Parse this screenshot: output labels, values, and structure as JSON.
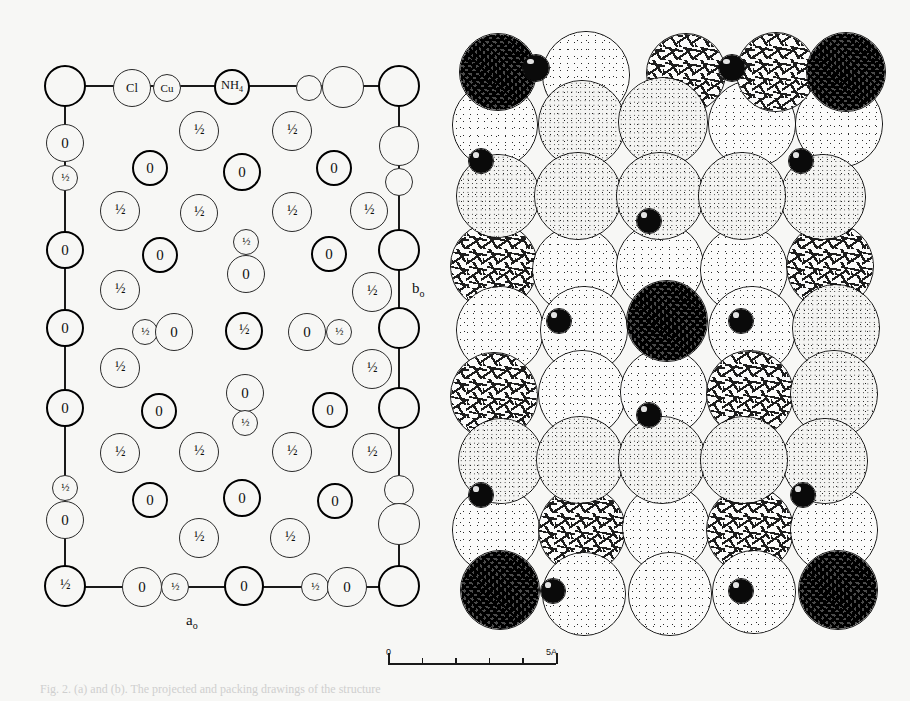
{
  "figure": {
    "caption": "Fig. 2. (a) and (b). The projected and packing drawings of the structure",
    "axis_a_label": "a",
    "axis_a_sub": "o",
    "axis_b_label": "b",
    "axis_b_sub": "o"
  },
  "scalebar": {
    "start_label": "0",
    "end_label": "5A",
    "major_ticks": 5,
    "minor_ticks": 4
  },
  "legend_labels": {
    "chlorine": "Cl",
    "copper": "Cu",
    "ammonium": "NH4",
    "ammonium_display": "NH",
    "ammonium_sub": "4",
    "oxygen": "0",
    "half_height": "1/2"
  },
  "left_panel": {
    "name": "projected-unit-cell",
    "atoms": [
      {
        "id": "a1",
        "x": 18,
        "y": 18,
        "r": 21,
        "weight": "bold",
        "label": "",
        "kind": "corner"
      },
      {
        "id": "a2",
        "x": 85,
        "y": 20,
        "r": 19,
        "weight": "thin",
        "label": "Cl",
        "kind": "named"
      },
      {
        "id": "a3",
        "x": 120,
        "y": 20,
        "r": 14,
        "weight": "thin",
        "label": "Cu",
        "kind": "named"
      },
      {
        "id": "a4",
        "x": 185,
        "y": 19,
        "r": 18,
        "weight": "bold",
        "label": "NH4",
        "kind": "named"
      },
      {
        "id": "a5",
        "x": 262,
        "y": 20,
        "r": 13,
        "weight": "thin",
        "label": "",
        "kind": "plain"
      },
      {
        "id": "a6",
        "x": 296,
        "y": 19,
        "r": 21,
        "weight": "thin",
        "label": "",
        "kind": "plain"
      },
      {
        "id": "a7",
        "x": 352,
        "y": 18,
        "r": 21,
        "weight": "bold",
        "label": "",
        "kind": "corner"
      },
      {
        "id": "b1",
        "x": 18,
        "y": 75,
        "r": 19,
        "weight": "thin",
        "label": "0",
        "kind": "o"
      },
      {
        "id": "b2",
        "x": 18,
        "y": 110,
        "r": 13,
        "weight": "thin",
        "label": "1/2",
        "kind": "half-sm"
      },
      {
        "id": "b3",
        "x": 352,
        "y": 78,
        "r": 20,
        "weight": "thin",
        "label": "",
        "kind": "plain"
      },
      {
        "id": "b4",
        "x": 352,
        "y": 114,
        "r": 14,
        "weight": "thin",
        "label": "",
        "kind": "plain"
      },
      {
        "id": "c1",
        "x": 152,
        "y": 63,
        "r": 20,
        "weight": "thin",
        "label": "1/2",
        "kind": "half"
      },
      {
        "id": "c2",
        "x": 245,
        "y": 63,
        "r": 20,
        "weight": "thin",
        "label": "1/2",
        "kind": "half"
      },
      {
        "id": "c3",
        "x": 103,
        "y": 100,
        "r": 18,
        "weight": "bold",
        "label": "0",
        "kind": "o"
      },
      {
        "id": "c4",
        "x": 195,
        "y": 104,
        "r": 19,
        "weight": "bold",
        "label": "0",
        "kind": "o"
      },
      {
        "id": "c5",
        "x": 287,
        "y": 100,
        "r": 18,
        "weight": "bold",
        "label": "0",
        "kind": "o"
      },
      {
        "id": "d1",
        "x": 73,
        "y": 143,
        "r": 20,
        "weight": "thin",
        "label": "1/2",
        "kind": "half"
      },
      {
        "id": "d2",
        "x": 152,
        "y": 145,
        "r": 19,
        "weight": "thin",
        "label": "1/2",
        "kind": "half"
      },
      {
        "id": "d3",
        "x": 245,
        "y": 144,
        "r": 20,
        "weight": "thin",
        "label": "1/2",
        "kind": "half"
      },
      {
        "id": "d4",
        "x": 322,
        "y": 143,
        "r": 19,
        "weight": "thin",
        "label": "1/2",
        "kind": "half"
      },
      {
        "id": "e1",
        "x": 18,
        "y": 182,
        "r": 19,
        "weight": "bold",
        "label": "0",
        "kind": "o"
      },
      {
        "id": "e2",
        "x": 113,
        "y": 187,
        "r": 18,
        "weight": "bold",
        "label": "0",
        "kind": "o"
      },
      {
        "id": "e3",
        "x": 199,
        "y": 174,
        "r": 13,
        "weight": "thin",
        "label": "1/2",
        "kind": "half-sm"
      },
      {
        "id": "e4",
        "x": 199,
        "y": 206,
        "r": 19,
        "weight": "thin",
        "label": "0",
        "kind": "o"
      },
      {
        "id": "e5",
        "x": 282,
        "y": 186,
        "r": 18,
        "weight": "bold",
        "label": "0",
        "kind": "o"
      },
      {
        "id": "e6",
        "x": 352,
        "y": 182,
        "r": 21,
        "weight": "bold",
        "label": "",
        "kind": "plain"
      },
      {
        "id": "f1",
        "x": 73,
        "y": 222,
        "r": 20,
        "weight": "thin",
        "label": "1/2",
        "kind": "half"
      },
      {
        "id": "f2",
        "x": 325,
        "y": 224,
        "r": 20,
        "weight": "thin",
        "label": "1/2",
        "kind": "half"
      },
      {
        "id": "g1",
        "x": 18,
        "y": 260,
        "r": 19,
        "weight": "bold",
        "label": "0",
        "kind": "o"
      },
      {
        "id": "g2",
        "x": 98,
        "y": 264,
        "r": 13,
        "weight": "thin",
        "label": "1/2",
        "kind": "half-sm"
      },
      {
        "id": "g3",
        "x": 127,
        "y": 264,
        "r": 19,
        "weight": "thin",
        "label": "0",
        "kind": "o"
      },
      {
        "id": "g4",
        "x": 197,
        "y": 263,
        "r": 19,
        "weight": "bold",
        "label": "1/2",
        "kind": "half"
      },
      {
        "id": "g5",
        "x": 260,
        "y": 264,
        "r": 19,
        "weight": "thin",
        "label": "0",
        "kind": "o"
      },
      {
        "id": "g6",
        "x": 292,
        "y": 264,
        "r": 13,
        "weight": "thin",
        "label": "1/2",
        "kind": "half-sm"
      },
      {
        "id": "g7",
        "x": 352,
        "y": 260,
        "r": 21,
        "weight": "bold",
        "label": "",
        "kind": "plain"
      },
      {
        "id": "h1",
        "x": 73,
        "y": 300,
        "r": 20,
        "weight": "thin",
        "label": "1/2",
        "kind": "half"
      },
      {
        "id": "h2",
        "x": 325,
        "y": 301,
        "r": 20,
        "weight": "thin",
        "label": "1/2",
        "kind": "half"
      },
      {
        "id": "i1",
        "x": 18,
        "y": 340,
        "r": 19,
        "weight": "bold",
        "label": "0",
        "kind": "o"
      },
      {
        "id": "i2",
        "x": 112,
        "y": 343,
        "r": 18,
        "weight": "bold",
        "label": "0",
        "kind": "o"
      },
      {
        "id": "i3",
        "x": 198,
        "y": 325,
        "r": 19,
        "weight": "thin",
        "label": "0",
        "kind": "o"
      },
      {
        "id": "i4",
        "x": 198,
        "y": 355,
        "r": 13,
        "weight": "thin",
        "label": "1/2",
        "kind": "half-sm"
      },
      {
        "id": "i5",
        "x": 283,
        "y": 342,
        "r": 18,
        "weight": "bold",
        "label": "0",
        "kind": "o"
      },
      {
        "id": "i6",
        "x": 352,
        "y": 340,
        "r": 21,
        "weight": "bold",
        "label": "",
        "kind": "plain"
      },
      {
        "id": "j1",
        "x": 73,
        "y": 385,
        "r": 20,
        "weight": "thin",
        "label": "1/2",
        "kind": "half"
      },
      {
        "id": "j2",
        "x": 152,
        "y": 384,
        "r": 20,
        "weight": "thin",
        "label": "1/2",
        "kind": "half"
      },
      {
        "id": "j3",
        "x": 245,
        "y": 384,
        "r": 20,
        "weight": "thin",
        "label": "1/2",
        "kind": "half"
      },
      {
        "id": "j4",
        "x": 325,
        "y": 385,
        "r": 20,
        "weight": "thin",
        "label": "1/2",
        "kind": "half"
      },
      {
        "id": "k1",
        "x": 18,
        "y": 420,
        "r": 13,
        "weight": "thin",
        "label": "1/2",
        "kind": "half-sm"
      },
      {
        "id": "k2",
        "x": 18,
        "y": 452,
        "r": 19,
        "weight": "thin",
        "label": "0",
        "kind": "o"
      },
      {
        "id": "k3",
        "x": 103,
        "y": 432,
        "r": 18,
        "weight": "bold",
        "label": "0",
        "kind": "o"
      },
      {
        "id": "k4",
        "x": 195,
        "y": 430,
        "r": 19,
        "weight": "bold",
        "label": "0",
        "kind": "o"
      },
      {
        "id": "k5",
        "x": 288,
        "y": 433,
        "r": 18,
        "weight": "bold",
        "label": "0",
        "kind": "o"
      },
      {
        "id": "k6",
        "x": 352,
        "y": 422,
        "r": 15,
        "weight": "thin",
        "label": "",
        "kind": "plain"
      },
      {
        "id": "k7",
        "x": 352,
        "y": 456,
        "r": 21,
        "weight": "thin",
        "label": "",
        "kind": "plain"
      },
      {
        "id": "l1",
        "x": 152,
        "y": 470,
        "r": 20,
        "weight": "thin",
        "label": "1/2",
        "kind": "half"
      },
      {
        "id": "l2",
        "x": 243,
        "y": 470,
        "r": 20,
        "weight": "thin",
        "label": "1/2",
        "kind": "half"
      },
      {
        "id": "m1",
        "x": 18,
        "y": 518,
        "r": 21,
        "weight": "bold",
        "label": "1/2",
        "kind": "half"
      },
      {
        "id": "m2",
        "x": 95,
        "y": 519,
        "r": 20,
        "weight": "thin",
        "label": "0",
        "kind": "o"
      },
      {
        "id": "m3",
        "x": 128,
        "y": 519,
        "r": 14,
        "weight": "thin",
        "label": "1/2",
        "kind": "half-sm"
      },
      {
        "id": "m4",
        "x": 197,
        "y": 518,
        "r": 20,
        "weight": "bold",
        "label": "0",
        "kind": "o"
      },
      {
        "id": "m5",
        "x": 268,
        "y": 519,
        "r": 14,
        "weight": "thin",
        "label": "1/2",
        "kind": "half-sm"
      },
      {
        "id": "m6",
        "x": 300,
        "y": 519,
        "r": 20,
        "weight": "thin",
        "label": "0",
        "kind": "o"
      },
      {
        "id": "m7",
        "x": 352,
        "y": 518,
        "r": 21,
        "weight": "bold",
        "label": "",
        "kind": "corner"
      }
    ]
  },
  "right_panel": {
    "name": "space-filling-packing",
    "spheres": [
      {
        "x": 9,
        "y": 3,
        "r": 39,
        "tex": "tex-dark",
        "z": 6
      },
      {
        "x": 92,
        "y": 1,
        "r": 44,
        "tex": "tex-light",
        "z": 3
      },
      {
        "x": 196,
        "y": 3,
        "r": 40,
        "tex": "tex-dash",
        "z": 3
      },
      {
        "x": 286,
        "y": 2,
        "r": 40,
        "tex": "tex-dash",
        "z": 3
      },
      {
        "x": 356,
        "y": 2,
        "r": 40,
        "tex": "tex-dark",
        "z": 6
      },
      {
        "x": 2,
        "y": 52,
        "r": 43,
        "tex": "tex-light",
        "z": 2
      },
      {
        "x": 88,
        "y": 50,
        "r": 44,
        "tex": "tex-med",
        "z": 4
      },
      {
        "x": 168,
        "y": 47,
        "r": 45,
        "tex": "tex-med",
        "z": 4
      },
      {
        "x": 258,
        "y": 50,
        "r": 44,
        "tex": "tex-light",
        "z": 2
      },
      {
        "x": 345,
        "y": 50,
        "r": 44,
        "tex": "tex-light",
        "z": 2
      },
      {
        "x": 6,
        "y": 124,
        "r": 42,
        "tex": "tex-med",
        "z": 4
      },
      {
        "x": 84,
        "y": 122,
        "r": 44,
        "tex": "tex-med",
        "z": 5
      },
      {
        "x": 166,
        "y": 122,
        "r": 44,
        "tex": "tex-med",
        "z": 5
      },
      {
        "x": 248,
        "y": 122,
        "r": 44,
        "tex": "tex-med",
        "z": 5
      },
      {
        "x": 330,
        "y": 124,
        "r": 43,
        "tex": "tex-med",
        "z": 4
      },
      {
        "x": 0,
        "y": 192,
        "r": 44,
        "tex": "tex-dash",
        "z": 2
      },
      {
        "x": 82,
        "y": 196,
        "r": 44,
        "tex": "tex-light",
        "z": 2
      },
      {
        "x": 166,
        "y": 192,
        "r": 44,
        "tex": "tex-light",
        "z": 2
      },
      {
        "x": 250,
        "y": 196,
        "r": 44,
        "tex": "tex-light",
        "z": 2
      },
      {
        "x": 336,
        "y": 192,
        "r": 44,
        "tex": "tex-dash",
        "z": 2
      },
      {
        "x": 176,
        "y": 250,
        "r": 41,
        "tex": "tex-dark",
        "z": 7
      },
      {
        "x": 6,
        "y": 256,
        "r": 44,
        "tex": "tex-light",
        "z": 2
      },
      {
        "x": 90,
        "y": 256,
        "r": 44,
        "tex": "tex-light",
        "z": 2
      },
      {
        "x": 258,
        "y": 256,
        "r": 44,
        "tex": "tex-light",
        "z": 2
      },
      {
        "x": 342,
        "y": 254,
        "r": 44,
        "tex": "tex-med",
        "z": 3
      },
      {
        "x": 0,
        "y": 322,
        "r": 44,
        "tex": "tex-dash",
        "z": 2
      },
      {
        "x": 88,
        "y": 320,
        "r": 44,
        "tex": "tex-light",
        "z": 2
      },
      {
        "x": 170,
        "y": 318,
        "r": 44,
        "tex": "tex-light",
        "z": 2
      },
      {
        "x": 256,
        "y": 320,
        "r": 44,
        "tex": "tex-dash",
        "z": 2
      },
      {
        "x": 340,
        "y": 320,
        "r": 44,
        "tex": "tex-med",
        "z": 3
      },
      {
        "x": 8,
        "y": 388,
        "r": 43,
        "tex": "tex-med",
        "z": 4
      },
      {
        "x": 86,
        "y": 386,
        "r": 44,
        "tex": "tex-med",
        "z": 5
      },
      {
        "x": 168,
        "y": 386,
        "r": 44,
        "tex": "tex-med",
        "z": 5
      },
      {
        "x": 250,
        "y": 386,
        "r": 44,
        "tex": "tex-med",
        "z": 5
      },
      {
        "x": 332,
        "y": 388,
        "r": 43,
        "tex": "tex-med",
        "z": 4
      },
      {
        "x": 2,
        "y": 456,
        "r": 44,
        "tex": "tex-light",
        "z": 2
      },
      {
        "x": 88,
        "y": 456,
        "r": 44,
        "tex": "tex-dash",
        "z": 2
      },
      {
        "x": 172,
        "y": 454,
        "r": 44,
        "tex": "tex-light",
        "z": 2
      },
      {
        "x": 256,
        "y": 456,
        "r": 44,
        "tex": "tex-dash",
        "z": 2
      },
      {
        "x": 340,
        "y": 456,
        "r": 44,
        "tex": "tex-light",
        "z": 2
      },
      {
        "x": 10,
        "y": 520,
        "r": 40,
        "tex": "tex-dark",
        "z": 6
      },
      {
        "x": 92,
        "y": 522,
        "r": 42,
        "tex": "tex-light",
        "z": 3
      },
      {
        "x": 178,
        "y": 522,
        "r": 42,
        "tex": "tex-light",
        "z": 3
      },
      {
        "x": 262,
        "y": 520,
        "r": 42,
        "tex": "tex-light",
        "z": 3
      },
      {
        "x": 348,
        "y": 520,
        "r": 40,
        "tex": "tex-dark",
        "z": 6
      }
    ],
    "small_black_spheres": [
      {
        "x": 72,
        "y": 24,
        "r": 14
      },
      {
        "x": 268,
        "y": 24,
        "r": 14
      },
      {
        "x": 18,
        "y": 118,
        "r": 13
      },
      {
        "x": 338,
        "y": 118,
        "r": 13
      },
      {
        "x": 186,
        "y": 178,
        "r": 13
      },
      {
        "x": 96,
        "y": 278,
        "r": 13
      },
      {
        "x": 278,
        "y": 278,
        "r": 13
      },
      {
        "x": 186,
        "y": 372,
        "r": 13
      },
      {
        "x": 18,
        "y": 452,
        "r": 13
      },
      {
        "x": 340,
        "y": 452,
        "r": 13
      },
      {
        "x": 90,
        "y": 548,
        "r": 13
      },
      {
        "x": 278,
        "y": 548,
        "r": 13
      }
    ]
  }
}
